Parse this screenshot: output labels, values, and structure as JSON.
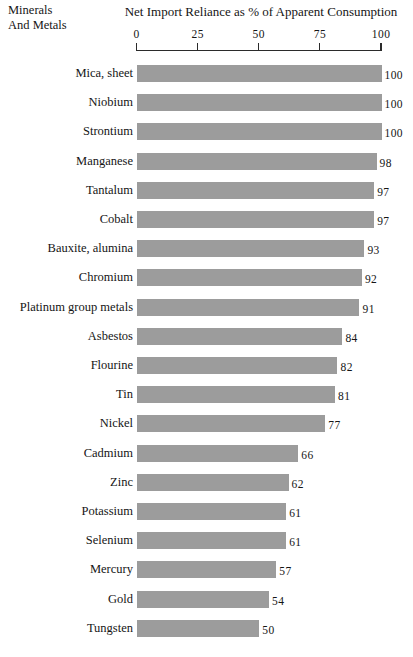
{
  "header": {
    "corner_line1": "Minerals",
    "corner_line2": "And Metals",
    "axis_title": "Net Import Reliance as % of Apparent Consumption"
  },
  "chart_data": {
    "type": "bar",
    "orientation": "horizontal",
    "title": "Net Import Reliance as % of Apparent Consumption",
    "xlabel": "Net Import Reliance as % of Apparent Consumption",
    "ylabel": "Minerals And Metals",
    "xlim": [
      0,
      100
    ],
    "ticks": [
      0,
      25,
      50,
      75,
      100
    ],
    "tick_labels": [
      "0",
      "25",
      "50",
      "75",
      "100"
    ],
    "axis_position": "top",
    "grid": false,
    "legend": null,
    "bar_color": "#9c9c9c",
    "value_labels": true,
    "categories": [
      "Mica, sheet",
      "Niobium",
      "Strontium",
      "Manganese",
      "Tantalum",
      "Cobalt",
      "Bauxite, alumina",
      "Chromium",
      "Platinum group metals",
      "Asbestos",
      "Flourine",
      "Tin",
      "Nickel",
      "Cadmium",
      "Zinc",
      "Potassium",
      "Selenium",
      "Mercury",
      "Gold",
      "Tungsten"
    ],
    "values": [
      100,
      100,
      100,
      98,
      97,
      97,
      93,
      92,
      91,
      84,
      82,
      81,
      77,
      66,
      62,
      61,
      61,
      57,
      54,
      50
    ],
    "value_text": [
      "100",
      "100",
      "100",
      "98",
      "97",
      "97",
      "93",
      "92",
      "91",
      "84",
      "82",
      "81",
      "77",
      "66",
      "62",
      "61",
      "61",
      "57",
      "54",
      "50"
    ]
  }
}
